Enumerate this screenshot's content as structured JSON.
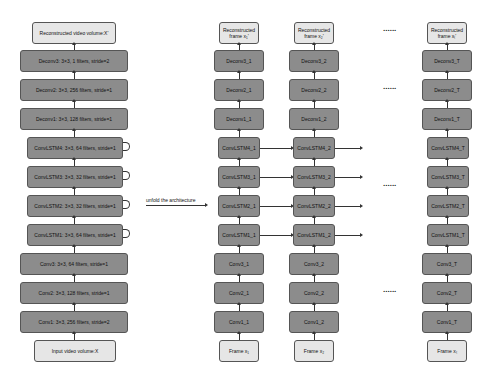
{
  "left": {
    "output": "Reconstructed video volume:X'",
    "layers": [
      "Deconv3: 3×3, 1 filters, stride=2",
      "Deconv2: 3×3, 256 filters, stride=1",
      "Deconv1: 3×3, 128 filters, stride=1",
      "ConvLSTM4: 3×3, 64 filters, stride=1",
      "ConvLSTM3: 3×3, 32 filters, stride=1",
      "ConvLSTM2: 3×3, 32 filters, stride=1",
      "ConvLSTM1: 3×3, 64 filters, stride=1",
      "Conv3: 3×3, 64 filters, stride=1",
      "Conv2: 3×3, 128 filters, stride=1",
      "Conv1: 3×3, 256 filters, stride=2"
    ],
    "input": "Input video volume:X"
  },
  "unfold_label": "unfold the architecture",
  "ellipsis": "......",
  "columns": [
    {
      "output": "Reconstructed frame x₁'",
      "layers": [
        "Deconv3_1",
        "Deconv2_1",
        "Deconv1_1",
        "ConvLSTM4_1",
        "ConvLSTM3_1",
        "ConvLSTM2_1",
        "ConvLSTM1_1",
        "Conv3_1",
        "Conv2_1",
        "Conv1_1"
      ],
      "input": "Frame x₁"
    },
    {
      "output": "Reconstructed frame x₂'",
      "layers": [
        "Deconv3_2",
        "Deconv2_2",
        "Deconv1_2",
        "ConvLSTM4_2",
        "ConvLSTM3_2",
        "ConvLSTM2_2",
        "ConvLSTM1_2",
        "Conv3_2",
        "Conv2_2",
        "Conv1_2"
      ],
      "input": "Frame x₂"
    },
    {
      "output": "Reconstructed frame xₜ'",
      "layers": [
        "Deconv3_T",
        "Deconv2_T",
        "Deconv1_T",
        "ConvLSTM4_T",
        "ConvLSTM3_T",
        "ConvLSTM2_T",
        "ConvLSTM1_T",
        "Conv3_T",
        "Conv2_T",
        "Conv1_T"
      ],
      "input": "Frame xₜ"
    }
  ],
  "colors": {
    "layer_fill": "#8c8c8c",
    "io_fill": "#e6e6e6",
    "border": "#555555"
  }
}
